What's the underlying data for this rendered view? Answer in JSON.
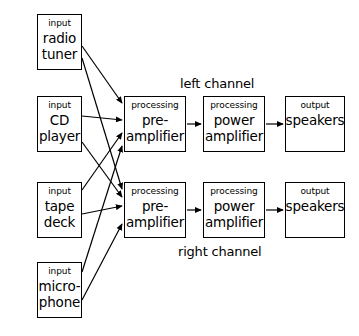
{
  "diagram": {
    "canvas": {
      "width": 359,
      "height": 336
    },
    "stroke_color": "#000000",
    "background_color": "#ffffff",
    "nodes": [
      {
        "id": "radio-tuner",
        "kind": "input",
        "label": "radio\ntuner",
        "x": 37,
        "y": 14,
        "w": 45,
        "h": 56
      },
      {
        "id": "cd-player",
        "kind": "input",
        "label": "CD\nplayer",
        "x": 37,
        "y": 96,
        "w": 45,
        "h": 56
      },
      {
        "id": "tape-deck",
        "kind": "input",
        "label": "tape\ndeck",
        "x": 37,
        "y": 182,
        "w": 45,
        "h": 56
      },
      {
        "id": "microphone",
        "kind": "input",
        "label": "micro-\nphone",
        "x": 37,
        "y": 262,
        "w": 45,
        "h": 56
      },
      {
        "id": "preamp-left",
        "kind": "processing",
        "label": "pre-\namplifier",
        "x": 124,
        "y": 96,
        "w": 62,
        "h": 56
      },
      {
        "id": "poweramp-left",
        "kind": "processing",
        "label": "power\namplifier",
        "x": 203,
        "y": 96,
        "w": 62,
        "h": 56
      },
      {
        "id": "speakers-left",
        "kind": "output",
        "label": "speakers",
        "x": 285,
        "y": 96,
        "w": 60,
        "h": 56
      },
      {
        "id": "preamp-right",
        "kind": "processing",
        "label": "pre-\namplifier",
        "x": 124,
        "y": 182,
        "w": 62,
        "h": 56
      },
      {
        "id": "poweramp-right",
        "kind": "processing",
        "label": "power\namplifier",
        "x": 203,
        "y": 182,
        "w": 62,
        "h": 56
      },
      {
        "id": "speakers-right",
        "kind": "output",
        "label": "speakers",
        "x": 285,
        "y": 182,
        "w": 60,
        "h": 56
      }
    ],
    "channel_labels": [
      {
        "id": "left-channel",
        "text": "left channel",
        "x": 180,
        "y": 76
      },
      {
        "id": "right-channel",
        "text": "right channel",
        "x": 178,
        "y": 244
      }
    ],
    "connections": [
      {
        "from": "radio-tuner",
        "to": "preamp-left",
        "x1": 82,
        "y1": 46,
        "x2": 122,
        "y2": 103
      },
      {
        "from": "radio-tuner",
        "to": "preamp-right",
        "x1": 82,
        "y1": 58,
        "x2": 122,
        "y2": 189
      },
      {
        "from": "cd-player",
        "to": "preamp-left",
        "x1": 82,
        "y1": 116,
        "x2": 122,
        "y2": 120
      },
      {
        "from": "cd-player",
        "to": "preamp-right",
        "x1": 82,
        "y1": 142,
        "x2": 122,
        "y2": 197
      },
      {
        "from": "tape-deck",
        "to": "preamp-left",
        "x1": 82,
        "y1": 190,
        "x2": 122,
        "y2": 133
      },
      {
        "from": "tape-deck",
        "to": "preamp-right",
        "x1": 82,
        "y1": 214,
        "x2": 122,
        "y2": 206
      },
      {
        "from": "microphone",
        "to": "preamp-left",
        "x1": 82,
        "y1": 272,
        "x2": 122,
        "y2": 146
      },
      {
        "from": "microphone",
        "to": "preamp-right",
        "x1": 82,
        "y1": 300,
        "x2": 122,
        "y2": 224
      },
      {
        "from": "preamp-left",
        "to": "poweramp-left",
        "x1": 187,
        "y1": 124,
        "x2": 201,
        "y2": 124
      },
      {
        "from": "poweramp-left",
        "to": "speakers-left",
        "x1": 266,
        "y1": 124,
        "x2": 283,
        "y2": 124
      },
      {
        "from": "preamp-right",
        "to": "poweramp-right",
        "x1": 187,
        "y1": 210,
        "x2": 201,
        "y2": 210
      },
      {
        "from": "poweramp-right",
        "to": "speakers-right",
        "x1": 266,
        "y1": 210,
        "x2": 283,
        "y2": 210
      }
    ]
  }
}
